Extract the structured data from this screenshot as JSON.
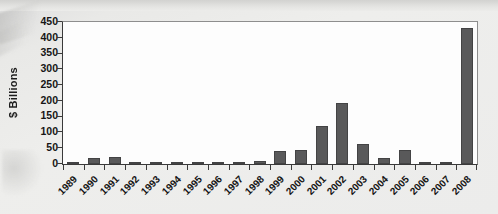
{
  "chart_data": {
    "type": "bar",
    "title": "",
    "subtitle": "",
    "xlabel": "",
    "ylabel": "$ Billions",
    "categories": [
      "1989",
      "1990",
      "1991",
      "1992",
      "1993",
      "1994",
      "1995",
      "1996",
      "1997",
      "1998",
      "1999",
      "2000",
      "2001",
      "2002",
      "2003",
      "2004",
      "2005",
      "2006",
      "2007",
      "2008"
    ],
    "values": [
      5,
      20,
      23,
      3,
      1,
      1,
      7,
      1,
      2,
      11,
      40,
      44,
      120,
      192,
      64,
      20,
      43,
      5,
      6,
      430
    ],
    "series": [
      {
        "name": "$ Billions",
        "values": [
          5,
          20,
          23,
          3,
          1,
          1,
          7,
          1,
          2,
          11,
          40,
          44,
          120,
          192,
          64,
          20,
          43,
          5,
          6,
          430
        ]
      }
    ],
    "ylim": [
      0,
      450
    ],
    "yticks": [
      0,
      50,
      100,
      150,
      200,
      250,
      300,
      350,
      400,
      450
    ],
    "ytick_labels": [
      "0",
      "50",
      "100",
      "150",
      "200",
      "250",
      "300",
      "350",
      "400",
      "450"
    ],
    "grid": false,
    "legend": "none",
    "bar_color": "#59595a",
    "bar_edge_color": "#434344",
    "plot_background": "#fdfdfd",
    "axis_color": "#3a3a3a",
    "page_background": "#ebebe9",
    "xtick_rotation": -45
  }
}
